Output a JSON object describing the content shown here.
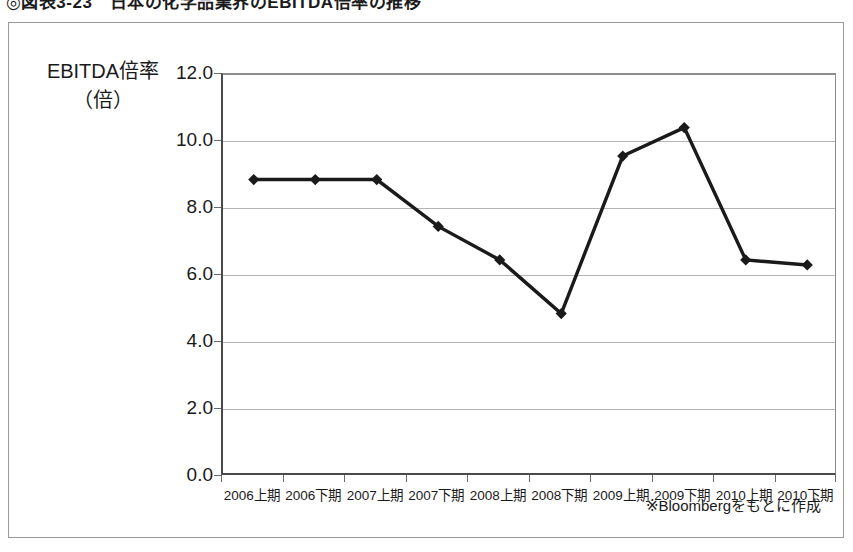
{
  "figure": {
    "title": "◎図表3-23　日本の化学品業界のEBITDA倍率の推移",
    "source_note": "※Bloombergをもとに作成"
  },
  "chart_data": {
    "type": "line",
    "title": "◎図表3-23　日本の化学品業界のEBITDA倍率の推移",
    "ylabel_line1": "EBITDA倍率",
    "ylabel_line2": "（倍）",
    "xlabel": "",
    "categories": [
      "2006上期",
      "2006下期",
      "2007上期",
      "2007下期",
      "2008上期",
      "2008下期",
      "2009上期",
      "2009下期",
      "2010上期",
      "2010下期"
    ],
    "values": [
      8.85,
      8.85,
      8.85,
      7.45,
      6.45,
      4.85,
      9.55,
      10.4,
      6.45,
      6.3
    ],
    "ylim": [
      0.0,
      12.0
    ],
    "ytick_step": 2.0,
    "ytick_labels": [
      "0.0",
      "2.0",
      "4.0",
      "6.0",
      "8.0",
      "10.0",
      "12.0"
    ],
    "grid": true,
    "legend": false,
    "marker": "diamond",
    "line_color": "#1a1a1a",
    "marker_color": "#1a1a1a",
    "grid_color": "#b4b4b4",
    "axis_color": "#4a4a4a"
  }
}
